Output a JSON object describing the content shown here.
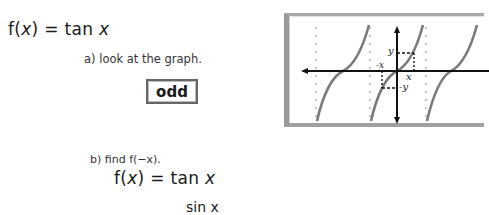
{
  "problem": {
    "function_lhs": "f(",
    "function_var": "x",
    "function_rhs": ") = tan ",
    "function_arg": "x"
  },
  "part_a": {
    "prompt": "a) look at the graph.",
    "answer": "odd"
  },
  "part_b": {
    "prompt": "b) find f(−x).",
    "line1_lhs": "f(",
    "line1_var": "x",
    "line1_rhs": ") = tan ",
    "line1_arg": "x",
    "line2_partial": "sin x"
  },
  "graph": {
    "title": "graph of y = tan x",
    "labels": {
      "y": "y",
      "neg_y": "-y",
      "x": "x",
      "neg_x": "-x"
    },
    "asymptotes_x_px": [
      311,
      365,
      421
    ],
    "zero_crossings_x_px": [
      338,
      392,
      446
    ],
    "axis_color": "#111111",
    "curve_color": "#777777"
  }
}
